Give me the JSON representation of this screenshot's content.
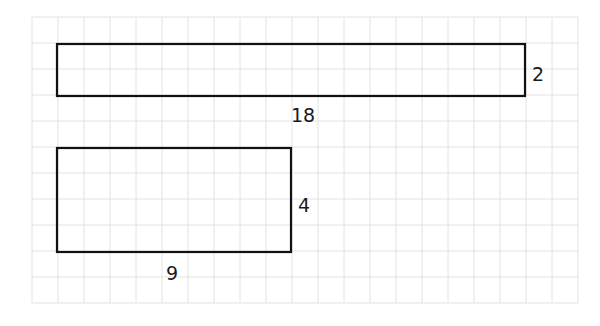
{
  "diagram": {
    "type": "grid-rectangles",
    "grid": {
      "origin_x": 32,
      "origin_y": 17,
      "cell_size": 26,
      "columns": 21,
      "rows": 11,
      "line_color": "#e2e2e2"
    },
    "shapes": [
      {
        "name": "long-rectangle",
        "col": 1,
        "row": 1,
        "width_units": 18,
        "height_units": 2,
        "width_label": "18",
        "height_label": "2"
      },
      {
        "name": "short-rectangle",
        "col": 1,
        "row": 5,
        "width_units": 9,
        "height_units": 4,
        "width_label": "9",
        "height_label": "4"
      }
    ],
    "stroke_color": "#111111"
  }
}
